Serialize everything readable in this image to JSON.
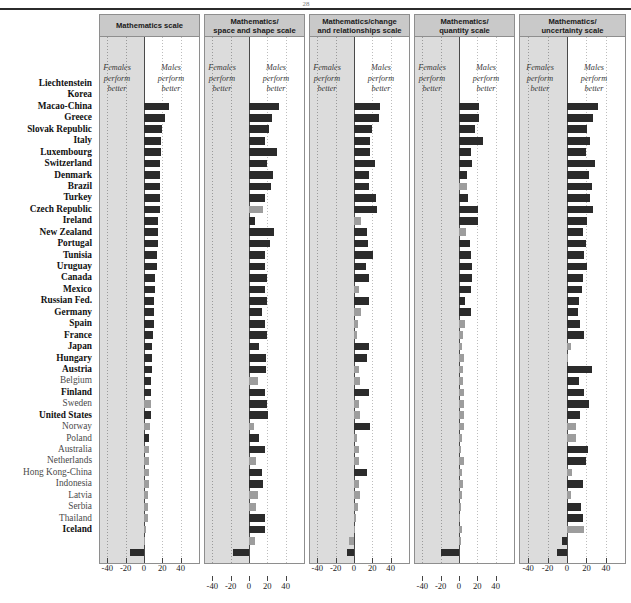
{
  "figure": {
    "page_marker": "28",
    "annotation_female": "Females\nperform\nbetter",
    "annotation_male": "Males\nperform\nbetter",
    "ann_line1_f": "Females",
    "ann_line2_f": "perform",
    "ann_line3_f": "better",
    "ann_line1_m": "Males",
    "ann_line2_m": "perform",
    "ann_line3_m": "better",
    "colors": {
      "significant_bar": "#2b2b2b",
      "non_significant_bar": "#9d9d9d",
      "panel_header_bg": "#c9c9c9",
      "shaded_region": "#dcdcdc",
      "panel_border": "#8e8e8e"
    }
  },
  "chart_data": {
    "type": "bar",
    "orientation": "horizontal",
    "title": "",
    "xlabel": "",
    "ylabel": "",
    "xlim": [
      -50,
      50
    ],
    "xticks": [
      -40,
      -20,
      0,
      20,
      40
    ],
    "xtick_labels": [
      "-40",
      "-20",
      "0",
      "20",
      "40"
    ],
    "grid": true,
    "legend": [
      {
        "label": "Statistically significant difference",
        "color": "#2b2b2b"
      },
      {
        "label": "Difference not statistically significant",
        "color": "#9d9d9d"
      }
    ],
    "note": "Score point difference (males minus females). Positive = males perform better, negative = females perform better.",
    "categories": [
      "Liechtenstein",
      "Korea",
      "Macao-China",
      "Greece",
      "Slovak Republic",
      "Italy",
      "Luxembourg",
      "Switzerland",
      "Denmark",
      "Brazil",
      "Turkey",
      "Czech Republic",
      "Ireland",
      "New Zealand",
      "Portugal",
      "Tunisia",
      "Uruguay",
      "Canada",
      "Mexico",
      "Russian Fed.",
      "Germany",
      "Spain",
      "France",
      "Japan",
      "Hungary",
      "Austria",
      "Belgium",
      "Finland",
      "Sweden",
      "United States",
      "Norway",
      "Poland",
      "Australia",
      "Netherlands",
      "Hong Kong-China",
      "Indonesia",
      "Latvia",
      "Serbia",
      "Thailand",
      "Iceland"
    ],
    "panels": [
      {
        "name": "Mathematics scale",
        "title_lines": [
          "Mathematics scale"
        ],
        "values": [
          27,
          23,
          20,
          19,
          19,
          18,
          17,
          17,
          17,
          17,
          15,
          15,
          15,
          14,
          14,
          12,
          12,
          11,
          11,
          11,
          10,
          9,
          9,
          9,
          8,
          8,
          8,
          8,
          7,
          6,
          6,
          5,
          5,
          5,
          4,
          4,
          4,
          2,
          1,
          -15
        ],
        "significant": [
          true,
          true,
          true,
          true,
          true,
          true,
          true,
          true,
          true,
          true,
          true,
          true,
          true,
          true,
          true,
          true,
          true,
          true,
          true,
          true,
          true,
          true,
          true,
          true,
          true,
          true,
          false,
          true,
          false,
          true,
          false,
          false,
          false,
          false,
          false,
          false,
          false,
          false,
          false,
          true
        ]
      },
      {
        "name": "Mathematics/space and shape scale",
        "title_lines": [
          "Mathematics/",
          "space and shape scale"
        ],
        "values": [
          33,
          25,
          22,
          18,
          31,
          20,
          26,
          24,
          17,
          15,
          7,
          27,
          23,
          18,
          17,
          20,
          18,
          20,
          14,
          17,
          20,
          11,
          19,
          19,
          10,
          18,
          20,
          21,
          5,
          11,
          17,
          8,
          14,
          15,
          10,
          8,
          18,
          17,
          7,
          -18
        ],
        "significant": [
          true,
          true,
          true,
          true,
          true,
          true,
          true,
          true,
          true,
          false,
          true,
          true,
          true,
          true,
          true,
          true,
          true,
          true,
          true,
          true,
          true,
          true,
          true,
          true,
          false,
          true,
          true,
          true,
          false,
          true,
          true,
          false,
          true,
          true,
          false,
          false,
          true,
          true,
          false,
          true
        ]
      },
      {
        "name": "Mathematics/change and relationships scale",
        "title_lines": [
          "Mathematics/change",
          "and relationships scale"
        ],
        "values": [
          28,
          27,
          20,
          18,
          18,
          23,
          16,
          16,
          24,
          25,
          8,
          14,
          15,
          21,
          13,
          16,
          6,
          16,
          8,
          4,
          3,
          16,
          14,
          5,
          7,
          16,
          6,
          7,
          17,
          3,
          5,
          6,
          14,
          5,
          7,
          4,
          2,
          1,
          -6,
          -8
        ],
        "significant": [
          true,
          true,
          true,
          true,
          true,
          true,
          true,
          true,
          true,
          true,
          false,
          true,
          true,
          true,
          true,
          true,
          false,
          true,
          false,
          false,
          false,
          true,
          true,
          false,
          false,
          true,
          false,
          false,
          true,
          false,
          false,
          false,
          true,
          false,
          false,
          false,
          false,
          false,
          false,
          true
        ]
      },
      {
        "name": "Mathematics/quantity scale",
        "title_lines": [
          "Mathematics/",
          "quantity scale"
        ],
        "values": [
          22,
          22,
          18,
          26,
          13,
          14,
          9,
          9,
          10,
          21,
          21,
          8,
          12,
          13,
          14,
          14,
          13,
          7,
          13,
          7,
          4,
          3,
          5,
          4,
          4,
          5,
          5,
          6,
          6,
          3,
          2,
          6,
          3,
          4,
          3,
          2,
          1,
          3,
          2,
          -20
        ],
        "significant": [
          true,
          true,
          true,
          true,
          true,
          true,
          true,
          false,
          true,
          true,
          true,
          false,
          true,
          true,
          true,
          true,
          true,
          true,
          true,
          false,
          false,
          false,
          false,
          false,
          false,
          false,
          false,
          false,
          false,
          false,
          false,
          false,
          false,
          false,
          false,
          false,
          false,
          false,
          false,
          true
        ]
      },
      {
        "name": "Mathematics/uncertainty scale",
        "title_lines": [
          "Mathematics/",
          "uncertainty scale"
        ],
        "values": [
          32,
          27,
          21,
          24,
          20,
          29,
          23,
          26,
          24,
          27,
          21,
          16,
          20,
          18,
          21,
          16,
          15,
          12,
          11,
          13,
          17,
          4,
          1,
          26,
          12,
          17,
          23,
          13,
          9,
          9,
          22,
          20,
          5,
          16,
          4,
          14,
          16,
          17,
          -5,
          -10
        ],
        "significant": [
          true,
          true,
          true,
          true,
          true,
          true,
          true,
          true,
          true,
          true,
          true,
          true,
          true,
          true,
          true,
          true,
          true,
          true,
          true,
          true,
          true,
          false,
          false,
          true,
          true,
          true,
          true,
          true,
          false,
          false,
          true,
          true,
          false,
          true,
          false,
          true,
          true,
          false,
          true,
          true
        ]
      }
    ]
  }
}
